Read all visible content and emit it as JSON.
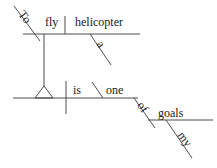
{
  "diagram": {
    "kind": "reed-kellogg-sentence-diagram",
    "sentence": "To fly a helicopter is one of my goals",
    "words": {
      "to": "To",
      "fly": "fly",
      "helicopter": "helicopter",
      "a": "a",
      "is": "is",
      "one": "one",
      "of": "of",
      "my": "my",
      "goals": "goals"
    },
    "colors": {
      "line": "#4d4d4d",
      "text": "#1a1a1a",
      "background": "#ffffff"
    }
  }
}
